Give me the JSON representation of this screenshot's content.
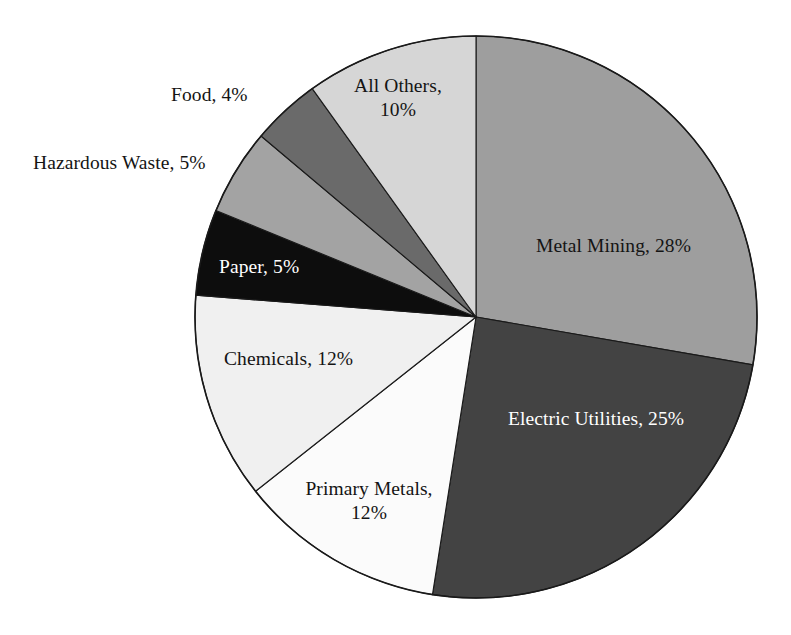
{
  "chart_data": {
    "type": "pie",
    "title": "",
    "subtitle": "",
    "xlabel": "",
    "ylabel": "",
    "legend_position": "none",
    "grid": false,
    "start_angle_deg": 0,
    "direction": "clockwise",
    "units": "percent",
    "categories": [
      "Metal Mining",
      "Electric Utilities",
      "Primary Metals",
      "Chemicals",
      "Paper",
      "Hazardous Waste",
      "Food",
      "All Others"
    ],
    "values": [
      28,
      25,
      12,
      12,
      5,
      5,
      4,
      10
    ],
    "slices": [
      {
        "name": "Metal Mining",
        "value": 28,
        "label": "Metal Mining, 28%",
        "color": "#9e9e9e",
        "label_placement": "inside",
        "label_color": "#141414"
      },
      {
        "name": "Electric Utilities",
        "value": 25,
        "label": "Electric Utilities, 25%",
        "color": "#434343",
        "label_placement": "inside",
        "label_color": "#ffffff"
      },
      {
        "name": "Primary Metals",
        "value": 12,
        "label": "Primary Metals,\n12%",
        "label_line1": "Primary Metals,",
        "label_line2": "12%",
        "color": "#fbfbfb",
        "label_placement": "inside",
        "label_color": "#141414"
      },
      {
        "name": "Chemicals",
        "value": 12,
        "label": "Chemicals, 12%",
        "color": "#f0f0f0",
        "label_placement": "inside",
        "label_color": "#141414"
      },
      {
        "name": "Paper",
        "value": 5,
        "label": "Paper, 5%",
        "color": "#0d0d0d",
        "label_placement": "inside",
        "label_color": "#ffffff"
      },
      {
        "name": "Hazardous Waste",
        "value": 5,
        "label": "Hazardous Waste, 5%",
        "color": "#a3a3a3",
        "label_placement": "outside",
        "label_color": "#141414"
      },
      {
        "name": "Food",
        "value": 4,
        "label": "Food, 4%",
        "color": "#6a6a6a",
        "label_placement": "outside",
        "label_color": "#141414"
      },
      {
        "name": "All Others",
        "value": 10,
        "label": "All Others,\n10%",
        "label_line1": "All Others,",
        "label_line2": "10%",
        "color": "#d6d6d6",
        "label_placement": "inside",
        "label_color": "#141414"
      }
    ]
  },
  "geometry": {
    "center_x": 476,
    "center_y": 317,
    "radius": 281
  },
  "labels": {
    "metal_mining": "Metal Mining, 28%",
    "electric_utilities": "Electric Utilities, 25%",
    "primary_metals_line1": "Primary Metals,",
    "primary_metals_line2": "12%",
    "chemicals": "Chemicals, 12%",
    "paper": "Paper, 5%",
    "hazardous_waste": "Hazardous Waste, 5%",
    "food": "Food, 4%",
    "all_others_line1": "All Others,",
    "all_others_line2": "10%"
  }
}
